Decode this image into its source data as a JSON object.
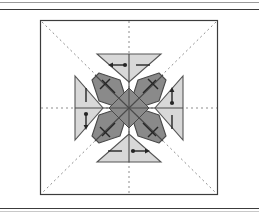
{
  "figure": {
    "title": "Symmetry element diagram",
    "frame": {
      "x": 40,
      "y": 20,
      "width": 178,
      "height": 175,
      "stroke": "#3c3c3c",
      "fill": "#ffffff"
    },
    "center": {
      "x": 129,
      "y": 108
    },
    "colors": {
      "background": "#ffffff",
      "triangle_fill": "#d8d8d8",
      "triangle_stroke": "#555555",
      "arm_fill": "#8a8a8a",
      "arm_stroke": "#4a4a4a",
      "marker_stroke": "#262626",
      "dotted_line": "#8d8d8d",
      "frame_stroke": "#3c3c3c",
      "rule_stroke": "#3c3c3c"
    },
    "rules": [
      {
        "name": "rule-top-a",
        "y": 2,
        "color": "#9a9a9a"
      },
      {
        "name": "rule-top-b",
        "y": 9,
        "color": "#3c3c3c"
      },
      {
        "name": "rule-bottom",
        "y": 208,
        "color": "#3c3c3c"
      },
      {
        "name": "rule-bottom-b",
        "y": 211,
        "color": "#c8c8c8"
      }
    ],
    "mirror_lines": [
      {
        "name": "horizontal-mirror",
        "orientation": "horizontal",
        "dash": "2 3"
      },
      {
        "name": "vertical-mirror",
        "orientation": "vertical",
        "dash": "2 3"
      },
      {
        "name": "diagonal-mirror-nwse",
        "orientation": "diagonal-nw-se",
        "dash": "2 3"
      },
      {
        "name": "diagonal-mirror-nesw",
        "orientation": "diagonal-ne-sw",
        "dash": "2 3"
      }
    ],
    "triangles": [
      {
        "name": "triangle-north",
        "position": "north",
        "points_toward": "center",
        "half_width": 32,
        "depth": 26
      },
      {
        "name": "triangle-south",
        "position": "south",
        "points_toward": "center",
        "half_width": 32,
        "depth": 26
      },
      {
        "name": "triangle-west",
        "position": "west",
        "points_toward": "center",
        "half_width": 32,
        "depth": 26
      },
      {
        "name": "triangle-east",
        "position": "east",
        "points_toward": "center",
        "half_width": 32,
        "depth": 26
      }
    ],
    "arms": [
      {
        "name": "arm-northwest",
        "angle_deg": 225,
        "length": 52,
        "half_width": 13
      },
      {
        "name": "arm-northeast",
        "angle_deg": 315,
        "length": 52,
        "half_width": 13
      },
      {
        "name": "arm-southeast",
        "angle_deg": 45,
        "length": 52,
        "half_width": 13
      },
      {
        "name": "arm-southwest",
        "angle_deg": 135,
        "length": 52,
        "half_width": 13
      }
    ],
    "markers": {
      "north": [
        {
          "name": "arrow-north-left",
          "type": "arrow-left-with-dot-tail",
          "direction": "left"
        },
        {
          "name": "arrow-north-right",
          "type": "plain-bar",
          "direction": "none"
        }
      ],
      "south": [
        {
          "name": "arrow-south-left",
          "type": "plain-bar",
          "direction": "none"
        },
        {
          "name": "arrow-south-right",
          "type": "arrow-right-with-dot-tail",
          "direction": "right"
        }
      ],
      "west": [
        {
          "name": "arrow-west-top",
          "type": "plain-bar-vertical",
          "direction": "none"
        },
        {
          "name": "arrow-west-bottom",
          "type": "arrow-down-with-dot-tail",
          "direction": "down"
        }
      ],
      "east": [
        {
          "name": "arrow-east-top",
          "type": "arrow-up-with-dot-tail",
          "direction": "up"
        },
        {
          "name": "arrow-east-bottom",
          "type": "plain-bar-vertical",
          "direction": "none"
        }
      ],
      "diagonals": [
        {
          "name": "marker-arm-northwest",
          "type": "barbed-tick",
          "arm": "northwest"
        },
        {
          "name": "marker-arm-northeast",
          "type": "barbed-tick",
          "arm": "northeast"
        },
        {
          "name": "marker-arm-southeast",
          "type": "barbed-tick",
          "arm": "southeast"
        },
        {
          "name": "marker-arm-southwest",
          "type": "barbed-tick",
          "arm": "southwest"
        }
      ]
    }
  }
}
